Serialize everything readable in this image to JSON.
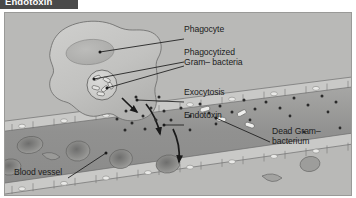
{
  "figure": {
    "title": "Endotoxin",
    "kind": "biology-diagram",
    "panel_background": "#b9b9b7",
    "title_banner_color": "#4a4a4a",
    "title_text_color": "#ffffff",
    "label_text_color": "#1c1c1c"
  },
  "labels": {
    "phagocyte": "Phagocyte",
    "phagocytized_line1": "Phagocytized",
    "phagocytized_line2": "Gram–  bacteria",
    "exocytosis": "Exocytosis",
    "endotoxin": "Endotoxin",
    "dead_bacterium_line1": "Dead Gram–",
    "dead_bacterium_line2": "bacterium",
    "blood_vessel": "Blood vessel"
  },
  "illustration": {
    "phagocyte_cell": "amoeboid phagocyte with lobed pseudopodia",
    "nucleus": "oval nucleus inside phagocyte",
    "phagosome": "circular vesicle containing ingested bacteria",
    "exocytosis_arrows": 3,
    "endotoxin_dots": 26,
    "blood_vessel": "diagonal vessel lined with endothelial cells",
    "red_blood_cells": 8,
    "dead_bacteria_rods": 4
  }
}
